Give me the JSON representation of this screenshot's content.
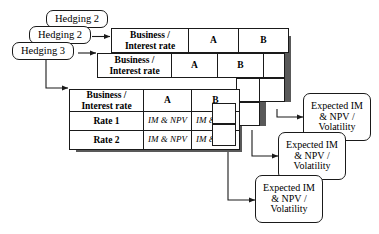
{
  "diagram": {
    "colors": {
      "stroke": "#1a1a1a",
      "fill": "#ffffff",
      "shadow": "#595959",
      "background": "#ffffff"
    },
    "hedging_nodes": [
      {
        "id": "hedging-top",
        "label": "Hedging 2"
      },
      {
        "id": "hedging-middle",
        "label": "Hedging 2"
      },
      {
        "id": "hedging-bottom",
        "label": "Hedging 3"
      }
    ],
    "matrices": [
      {
        "id": "matrix-back",
        "corner_header_line1": "Business /",
        "corner_header_line2": "Interest rate",
        "column_headers": [
          "A",
          "B"
        ],
        "row_headers": [],
        "cells": []
      },
      {
        "id": "matrix-middle",
        "corner_header_line1": "Business /",
        "corner_header_line2": "Interest rate",
        "column_headers": [
          "A",
          "B"
        ],
        "row_headers": [],
        "cells": []
      },
      {
        "id": "matrix-front",
        "corner_header_line1": "Business /",
        "corner_header_line2": "Interest rate",
        "column_headers": [
          "A",
          "B"
        ],
        "row_headers": [
          "Rate 1",
          "Rate 2"
        ],
        "cells": [
          [
            "IM & NPV",
            "IM & NPV"
          ],
          [
            "IM & NPV",
            "IM & NPV"
          ]
        ]
      }
    ],
    "outputs": [
      {
        "id": "expected-top",
        "line1": "Expected IM",
        "line2": "& NPV /",
        "line3": "Volatility"
      },
      {
        "id": "expected-middle",
        "line1": "Expected IM",
        "line2": "& NPV /",
        "line3": "Volatility"
      },
      {
        "id": "expected-bottom",
        "line1": "Expected IM",
        "line2": "& NPV /",
        "line3": "Volatility"
      }
    ]
  }
}
